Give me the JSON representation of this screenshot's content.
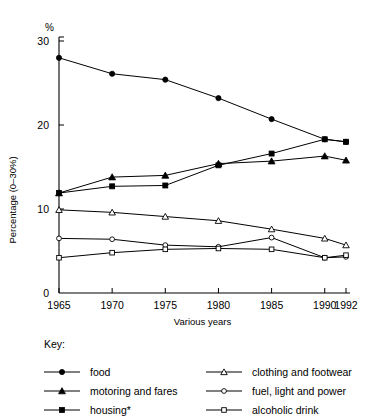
{
  "axes": {
    "y_unit_label": "%",
    "y_axis_title": "Percentage (0–30%)",
    "x_axis_title": "Various years",
    "y_ticks": [
      "0",
      "10",
      "20",
      "30"
    ],
    "x_ticks": [
      "1965",
      "1970",
      "1975",
      "1980",
      "1985",
      "1990",
      "1992"
    ]
  },
  "key": {
    "title": "Key:",
    "entries": [
      {
        "label": "food",
        "marker": "filled-circle"
      },
      {
        "label": "motoring and fares",
        "marker": "filled-triangle"
      },
      {
        "label": "housing*",
        "marker": "filled-square"
      },
      {
        "label": "clothing and footwear",
        "marker": "open-triangle"
      },
      {
        "label": "fuel, light and power",
        "marker": "open-circle"
      },
      {
        "label": "alcoholic drink",
        "marker": "open-square"
      }
    ]
  },
  "chart_data": {
    "type": "line",
    "title": "",
    "xlabel": "Various years",
    "ylabel": "Percentage (0–30%)",
    "x": [
      1965,
      1970,
      1975,
      1980,
      1985,
      1990,
      1992
    ],
    "xlim": [
      1965,
      1992
    ],
    "ylim": [
      0,
      30
    ],
    "ytick_values": [
      0,
      10,
      20,
      30
    ],
    "grid": false,
    "legend_position": "below-plot",
    "series": [
      {
        "name": "food",
        "marker": "filled-circle",
        "values": [
          28.0,
          26.1,
          25.4,
          23.2,
          20.7,
          18.3,
          18.0
        ]
      },
      {
        "name": "motoring and fares",
        "marker": "filled-triangle",
        "values": [
          11.9,
          13.8,
          14.0,
          15.4,
          15.7,
          16.3,
          15.8
        ]
      },
      {
        "name": "housing*",
        "marker": "filled-square",
        "values": [
          11.9,
          12.7,
          12.8,
          15.2,
          16.6,
          18.3,
          18.0
        ]
      },
      {
        "name": "clothing and footwear",
        "marker": "open-triangle",
        "values": [
          9.9,
          9.6,
          9.1,
          8.6,
          7.6,
          6.5,
          5.7
        ]
      },
      {
        "name": "fuel, light and power",
        "marker": "open-circle",
        "values": [
          6.5,
          6.4,
          5.7,
          5.5,
          6.6,
          4.2,
          4.3
        ]
      },
      {
        "name": "alcoholic drink",
        "marker": "open-square",
        "values": [
          4.2,
          4.8,
          5.2,
          5.3,
          5.2,
          4.2,
          4.5
        ]
      }
    ]
  }
}
